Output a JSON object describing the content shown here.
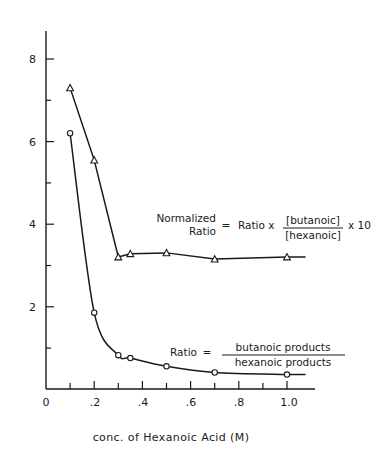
{
  "chart_data": {
    "type": "line",
    "title": "",
    "xlabel": "conc. of Hexanoic Acid (M)",
    "ylabel": "",
    "xlim": [
      0,
      1.05
    ],
    "ylim": [
      0,
      8.6
    ],
    "grid": false,
    "legend_position": "inline-annotation",
    "x_ticks_major": [
      "0",
      ".2",
      ".4",
      ".6",
      ".8",
      "1.0"
    ],
    "x_tick_major_values": [
      0,
      0.2,
      0.4,
      0.6,
      0.8,
      1.0
    ],
    "x_tick_minor_values": [
      0.1,
      0.3,
      0.5,
      0.7,
      0.9
    ],
    "y_ticks_major": [
      "2",
      "4",
      "6",
      "8"
    ],
    "y_tick_major_values": [
      2,
      4,
      6,
      8
    ],
    "y_tick_minor_values": [
      1,
      3,
      5,
      7
    ],
    "series": [
      {
        "name": "Normalized Ratio",
        "marker": "triangle",
        "x": [
          0.1,
          0.2,
          0.3,
          0.35,
          0.5,
          0.7,
          1.0
        ],
        "values": [
          7.3,
          5.55,
          3.2,
          3.28,
          3.3,
          3.15,
          3.2
        ]
      },
      {
        "name": "Ratio",
        "marker": "circle",
        "x": [
          0.1,
          0.2,
          0.3,
          0.35,
          0.5,
          0.7,
          1.0
        ],
        "values": [
          6.2,
          1.85,
          0.82,
          0.75,
          0.55,
          0.4,
          0.35
        ]
      }
    ],
    "annotations": [
      {
        "id": "normalized-ratio-formula",
        "lhs_line1": "Normalized",
        "lhs_line2": "Ratio",
        "equals": "=",
        "rhs_prefix": "Ratio  x",
        "numerator": "[butanoic]",
        "denominator": "[hexanoic]",
        "rhs_suffix": "x  10"
      },
      {
        "id": "ratio-formula",
        "lhs": "Ratio",
        "equals": "=",
        "numerator": "butanoic  products",
        "denominator": "hexanoic  products"
      }
    ]
  },
  "colors": {
    "ink": "#1a1a1a",
    "background": "#ffffff"
  }
}
